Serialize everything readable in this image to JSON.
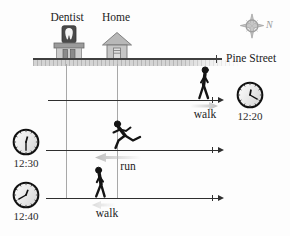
{
  "landmarks": {
    "dentist": {
      "label": "Dentist",
      "icon": "dentist-office-building-icon"
    },
    "home": {
      "label": "Home",
      "icon": "house-icon"
    }
  },
  "street": {
    "name": "Pine Street"
  },
  "compass": {
    "north_label": "N",
    "icon": "compass-rose-icon"
  },
  "timeline_rows": [
    {
      "time": "12:20",
      "action_label": "walk",
      "person_icon": "walking-person-east-icon",
      "motion_direction": "east"
    },
    {
      "time": "12:30",
      "action_label": "run",
      "person_icon": "running-person-west-icon",
      "motion_direction": "west"
    },
    {
      "time": "12:40",
      "action_label": "walk",
      "person_icon": "walking-person-west-icon",
      "motion_direction": "west"
    }
  ],
  "colors": {
    "background": "#fdfdfd",
    "text": "#1c1c1c",
    "timeline_line": "#2f2f2f",
    "reference_line": "#a8a8a8",
    "street_band": "#d4d4d4",
    "motion_arrow": "#c3c3c3",
    "building_gray": "#c6c6c6",
    "sign_dark": "#4a4a4a",
    "compass_gray": "#b0b0b0",
    "silhouette": "#141414"
  }
}
